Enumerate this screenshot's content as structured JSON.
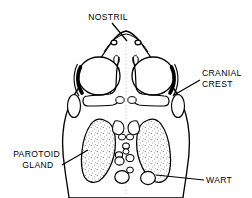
{
  "figure": {
    "name": "toad-head-dorsal-anatomy",
    "view": "dorsal",
    "symmetry": "bilateral",
    "background_color": "#ffffff",
    "line_color": "#000000",
    "stipple_color": "#555555",
    "width": 252,
    "height": 198
  },
  "labels": [
    {
      "id": "nostril",
      "lines": [
        "NOSTRIL"
      ],
      "text_anchor": "middle",
      "text_x": 108,
      "text_y": 20,
      "line_height": 11,
      "leader": {
        "x1": 112,
        "y1": 23,
        "x2": 127,
        "y2": 41
      }
    },
    {
      "id": "cranial-crest",
      "lines": [
        "CRANIAL",
        "CREST"
      ],
      "text_anchor": "start",
      "text_x": 202,
      "text_y": 76,
      "line_height": 11,
      "leader": {
        "x1": 200,
        "y1": 80,
        "x2": 174,
        "y2": 95
      }
    },
    {
      "id": "parotoid-gland",
      "lines": [
        "PAROTOID",
        "GLAND"
      ],
      "text_anchor": "middle",
      "text_x": 38,
      "text_y": 157,
      "line_height": 11,
      "leader": {
        "x1": 62,
        "y1": 165,
        "x2": 88,
        "y2": 150
      }
    },
    {
      "id": "wart",
      "lines": [
        "WART"
      ],
      "text_anchor": "start",
      "text_x": 206,
      "text_y": 183,
      "line_height": 11,
      "leader": {
        "x1": 204,
        "y1": 180,
        "x2": 156,
        "y2": 175
      }
    }
  ],
  "anatomy": {
    "head_outline": "dorsal head silhouette, pointed snout at top, widening posteriorly, cut off at bottom edge",
    "features": [
      {
        "name": "nostril",
        "count": 2,
        "shape": "small circle",
        "position": "paired, near snout tip"
      },
      {
        "name": "orbit",
        "count": 2,
        "shape": "large oval",
        "position": "paired, upper-mid head"
      },
      {
        "name": "cranial-crest",
        "count": 2,
        "shape": "thick dark arc",
        "position": "posterior-lateral margin of each orbit"
      },
      {
        "name": "tympanum",
        "count": 2,
        "shape": "vertical oval",
        "position": "lateral, behind orbit"
      },
      {
        "name": "parotoid-gland",
        "count": 2,
        "shape": "large stippled lobe",
        "position": "posterior-lateral, behind tympanum"
      },
      {
        "name": "wart",
        "count": 7,
        "shape": "small circle",
        "position": "scattered along midline and between glands"
      },
      {
        "name": "midline",
        "count": 1,
        "shape": "faint dotted vertical line",
        "position": "sagittal center"
      }
    ]
  }
}
